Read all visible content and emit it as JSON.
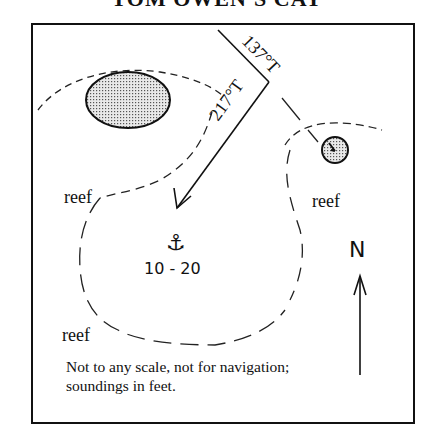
{
  "title": "TOM OWEN'S CAY",
  "bearings": {
    "approach": "217°T",
    "departure": "137°T"
  },
  "labels": {
    "reef_left": "reef",
    "reef_right": "reef",
    "reef_bottom": "reef",
    "north": "N",
    "soundings": "10 - 20"
  },
  "icons": {
    "anchorage": "⚓"
  },
  "note": {
    "line1": "Not to any scale, not for navigation;",
    "line2": "soundings in feet."
  }
}
